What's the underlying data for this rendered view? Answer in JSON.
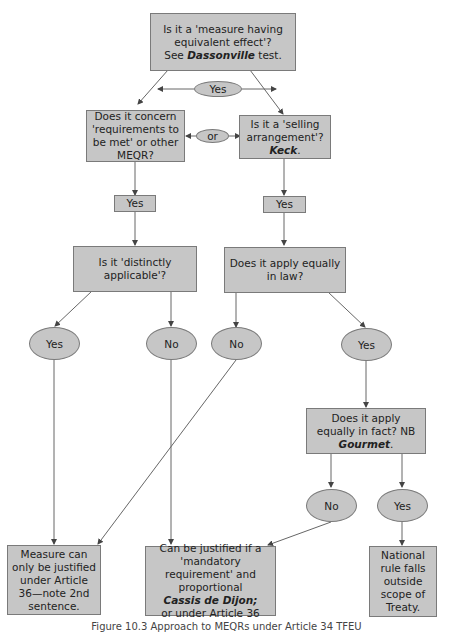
{
  "diagram": {
    "nodes": {
      "meqe": {
        "line1": "Is it a 'measure having equivalent effect'?",
        "line2": "See ",
        "bold": "Dassonville",
        "line3": " test."
      },
      "requirements": {
        "text": "Does it concern 'requirements to be met' or other MEQR?"
      },
      "selling": {
        "text": "Is it a 'selling arrangement'?",
        "bold": "Keck",
        "suffix": "."
      },
      "or_oval": {
        "text": "or"
      },
      "yes_top": {
        "text": "Yes"
      },
      "yes_left": {
        "text": "Yes"
      },
      "yes_right": {
        "text": "Yes"
      },
      "distinct": {
        "text": "Is it 'distinctly applicable'?"
      },
      "equal_law": {
        "text": "Does it apply equally in law?"
      },
      "oval_yes_1": {
        "text": "Yes"
      },
      "oval_no_1": {
        "text": "No"
      },
      "oval_no_2": {
        "text": "No"
      },
      "oval_yes_2": {
        "text": "Yes"
      },
      "equal_fact": {
        "text": "Does it apply equally in fact? NB ",
        "bold": "Gourmet",
        "suffix": "."
      },
      "oval_no_3": {
        "text": "No"
      },
      "oval_yes_3": {
        "text": "Yes"
      },
      "art36": {
        "text": "Measure can only be justified under Article 36—note 2nd sentence."
      },
      "cassis": {
        "text": "Can be justified if a 'mandatory requirement' and proportional",
        "bold": "Cassis de Dijon;",
        "suffix": "or under Article 36"
      },
      "outside": {
        "text": "National rule falls outside scope of Treaty."
      }
    },
    "caption": "Figure 10.3 Approach to MEQRs under Article 34 TFEU"
  },
  "colors": {
    "box_fill": "#c6c6c6",
    "border": "#7a7a7a",
    "line": "#555555"
  }
}
